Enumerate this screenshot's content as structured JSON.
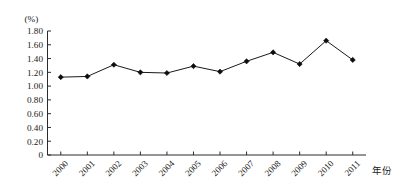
{
  "chart_data": {
    "type": "line",
    "title": "",
    "subtitle": "",
    "unit_label": "(%)",
    "xlabel": "年份",
    "ylabel": "",
    "categories": [
      "2000",
      "2001",
      "2002",
      "2003",
      "2004",
      "2005",
      "2006",
      "2007",
      "2008",
      "2009",
      "2010",
      "2011"
    ],
    "values": [
      1.13,
      1.14,
      1.31,
      1.2,
      1.19,
      1.29,
      1.21,
      1.36,
      1.49,
      1.32,
      1.66,
      1.38
    ],
    "series": [
      {
        "name": "",
        "values": [
          1.13,
          1.14,
          1.31,
          1.2,
          1.19,
          1.29,
          1.21,
          1.36,
          1.49,
          1.32,
          1.66,
          1.38
        ]
      }
    ],
    "ylim": [
      0,
      1.8
    ],
    "ytick_labels": [
      "1.80",
      "1.60",
      "1.40",
      "1.20",
      "1.00",
      "0.80",
      "0.60",
      "0.40",
      "0.20",
      "0"
    ],
    "ytick_values": [
      1.8,
      1.6,
      1.4,
      1.2,
      1.0,
      0.8,
      0.6,
      0.4,
      0.2,
      0
    ],
    "xtick_labels": [
      "2000",
      "2001",
      "2002",
      "2003",
      "2004",
      "2005",
      "2006",
      "2007",
      "2008",
      "2009",
      "2010",
      "2011"
    ],
    "grid": false,
    "legend": false,
    "legend_position": "none",
    "marker": "diamond",
    "marker_color": "#0d0d0d",
    "line_color": "#1a1a1a",
    "axis_color": "#2b2b2b",
    "background": "#ffffff",
    "xtick_label_rotation": -45
  }
}
